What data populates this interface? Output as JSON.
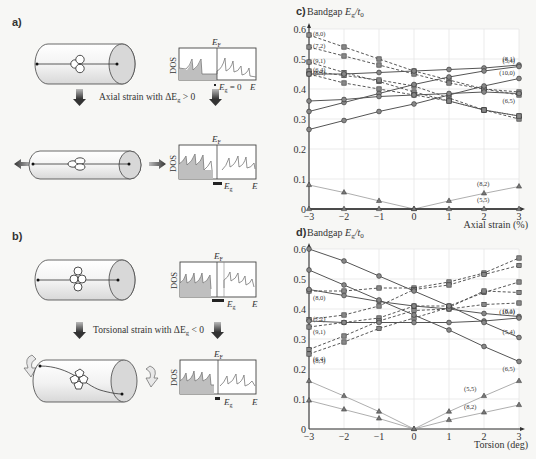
{
  "panels": {
    "a": {
      "label": "a)",
      "strain_caption": "Axial strain with ΔE",
      "strain_caption_sub": "g",
      "strain_caption_tail": " > 0",
      "dos_top": {
        "ef_label": "E",
        "ef_sub": "F",
        "ylabel": "DOS",
        "eg_label": "E",
        "eg_sub": "g",
        "eg_tail": " = 0",
        "x_label": "E"
      },
      "dos_bottom": {
        "ef_label": "E",
        "ef_sub": "F",
        "ylabel": "DOS",
        "eg_label": "E",
        "eg_sub": "g",
        "x_label": "E"
      }
    },
    "b": {
      "label": "b)",
      "strain_caption": "Torsional strain with ΔE",
      "strain_caption_sub": "g",
      "strain_caption_tail": " < 0",
      "dos_top": {
        "ef_label": "E",
        "ef_sub": "F",
        "ylabel": "DOS",
        "eg_label": "E",
        "eg_sub": "g",
        "x_label": "E"
      },
      "dos_bottom": {
        "ef_label": "E",
        "ef_sub": "F",
        "ylabel": "DOS",
        "eg_label": "E",
        "eg_sub": "g",
        "x_label": "E"
      }
    }
  },
  "chart_data": [
    {
      "id": "c",
      "panel_label": "c)",
      "type": "line",
      "title": "Bandgap Eg/t0",
      "ylabel": "Bandgap E_g/t_0",
      "xlabel": "Axial strain (%)",
      "x": [
        -3,
        -2,
        -1,
        0,
        1,
        2,
        3
      ],
      "xticks": [
        "−3",
        "−2",
        "−1",
        "0",
        "1",
        "2",
        "3"
      ],
      "yticks": [
        "0",
        "0.1",
        "0.2",
        "0.3",
        "0.4",
        "0.5",
        "0.6"
      ],
      "ylim": [
        0,
        0.6
      ],
      "grid": true,
      "series": [
        {
          "name": "(8,0)",
          "style": "dashed",
          "marker": "square",
          "values": [
            0.58,
            0.54,
            0.5,
            0.46,
            0.43,
            0.4,
            0.38
          ],
          "label_side": "left"
        },
        {
          "name": "(7,2)",
          "style": "dashed",
          "marker": "square",
          "values": [
            0.54,
            0.51,
            0.48,
            0.45,
            0.42,
            0.4,
            0.39
          ],
          "label_side": "left"
        },
        {
          "name": "(9,1)",
          "style": "dashed",
          "marker": "square",
          "values": [
            0.49,
            0.455,
            0.425,
            0.39,
            0.36,
            0.33,
            0.31
          ],
          "label_side": "left"
        },
        {
          "name": "(6,4)",
          "style": "dashed",
          "marker": "square",
          "values": [
            0.46,
            0.445,
            0.43,
            0.41,
            0.37,
            0.33,
            0.3
          ],
          "label_side": "left"
        },
        {
          "name": "(8,3)",
          "style": "dashed",
          "marker": "square",
          "values": [
            0.45,
            0.42,
            0.4,
            0.38,
            0.36,
            0.33,
            0.31
          ],
          "label_side": "left"
        },
        {
          "name": "(8,1)",
          "style": "solid",
          "marker": "circle",
          "values": [
            0.45,
            0.45,
            0.455,
            0.46,
            0.465,
            0.47,
            0.48
          ],
          "label_side": "right"
        },
        {
          "name": "(5,4)",
          "style": "solid",
          "marker": "circle",
          "values": [
            0.325,
            0.355,
            0.385,
            0.415,
            0.44,
            0.46,
            0.475
          ],
          "label_side": "right"
        },
        {
          "name": "(10,0)",
          "style": "solid",
          "marker": "circle",
          "values": [
            0.265,
            0.295,
            0.325,
            0.35,
            0.38,
            0.41,
            0.435
          ],
          "label_side": "right"
        },
        {
          "name": "(6,5)",
          "style": "solid",
          "marker": "circle",
          "values": [
            0.36,
            0.365,
            0.375,
            0.38,
            0.385,
            0.39,
            0.385
          ],
          "label_side": "right"
        },
        {
          "name": "(8,2)",
          "style": "thin",
          "marker": "triangle",
          "values": [
            0.08,
            0.055,
            0.027,
            0.0,
            0.027,
            0.052,
            0.075
          ],
          "label_at": 5,
          "label_dy": -7
        },
        {
          "name": "(5,5)",
          "style": "solid-dark",
          "marker": "triangle",
          "values": [
            0,
            0,
            0,
            0,
            0,
            0,
            0
          ],
          "label_at": 5,
          "label_dy": -7
        }
      ]
    },
    {
      "id": "d",
      "panel_label": "d)",
      "type": "line",
      "title": "Bandgap Eg/t0",
      "ylabel": "Bandgap E_g/t_0",
      "xlabel": "Torsion (deg)",
      "x": [
        -3,
        -2,
        -1,
        0,
        1,
        2,
        3
      ],
      "xticks": [
        "−3",
        "−2",
        "−1",
        "0",
        "1",
        "2",
        "3"
      ],
      "yticks": [
        "0",
        "0.1",
        "0.2",
        "0.3",
        "0.4",
        "0.5",
        "0.6"
      ],
      "ylim": [
        0,
        0.6
      ],
      "grid": true,
      "series": [
        {
          "name": "(8,0)",
          "style": "dashed",
          "marker": "square",
          "values": [
            0.46,
            0.46,
            0.47,
            0.47,
            0.49,
            0.52,
            0.57
          ],
          "label_side": "left",
          "label_dy": 8
        },
        {
          "name": "(7,2)",
          "style": "dashed",
          "marker": "square",
          "values": [
            0.365,
            0.38,
            0.41,
            0.465,
            0.48,
            0.515,
            0.545
          ],
          "label_side": "left"
        },
        {
          "name": "(9,1)",
          "style": "dashed",
          "marker": "square",
          "values": [
            0.34,
            0.355,
            0.37,
            0.41,
            0.41,
            0.455,
            0.49
          ],
          "label_side": "left",
          "label_dy": 6
        },
        {
          "name": "(6,4)",
          "style": "dashed",
          "marker": "square",
          "values": [
            0.265,
            0.31,
            0.36,
            0.395,
            0.4,
            0.415,
            0.42
          ],
          "label_side": "left",
          "label_dy": 10
        },
        {
          "name": "(8,3)",
          "style": "dashed",
          "marker": "square",
          "values": [
            0.25,
            0.29,
            0.335,
            0.37,
            0.405,
            0.46,
            0.455
          ],
          "label_side": "left",
          "label_dy": 8
        },
        {
          "name": "(8,1)",
          "style": "solid",
          "marker": "circle",
          "values": [
            0.465,
            0.445,
            0.425,
            0.41,
            0.4,
            0.385,
            0.375
          ],
          "label_side": "right"
        },
        {
          "name": "(10,0)",
          "style": "solid",
          "marker": "circle",
          "values": [
            0.36,
            0.355,
            0.355,
            0.355,
            0.355,
            0.36,
            0.37
          ],
          "label_side": "right"
        },
        {
          "name": "(5,4)",
          "style": "solid",
          "marker": "circle",
          "values": [
            0.6,
            0.56,
            0.51,
            0.46,
            0.41,
            0.355,
            0.305
          ],
          "label_side": "right"
        },
        {
          "name": "(6,5)",
          "style": "solid",
          "marker": "circle",
          "values": [
            0.53,
            0.48,
            0.43,
            0.38,
            0.33,
            0.275,
            0.225
          ],
          "label_side": "right"
        },
        {
          "name": "(5,5)",
          "style": "thin",
          "marker": "triangle",
          "values": [
            0.16,
            0.11,
            0.058,
            0.0,
            0.058,
            0.11,
            0.16
          ],
          "label_at": 5,
          "label_dx": -20,
          "label_dy": -5
        },
        {
          "name": "(8,2)",
          "style": "thin",
          "marker": "triangle",
          "values": [
            0.095,
            0.065,
            0.035,
            0.0,
            0.03,
            0.055,
            0.08
          ],
          "label_at": 5,
          "label_dx": -20,
          "label_dy": -4
        }
      ]
    }
  ]
}
